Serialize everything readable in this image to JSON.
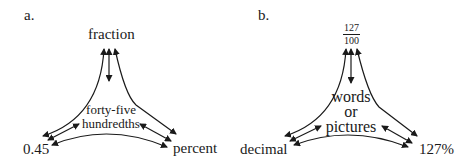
{
  "diagrams": [
    {
      "panel_label": "a.",
      "top_node": "fraction",
      "left_node": "0.45",
      "right_node": "percent",
      "center": {
        "line1": "forty-five",
        "line2": "hundredths"
      }
    },
    {
      "panel_label": "b.",
      "top_node": {
        "numerator": "127",
        "denominator": "100"
      },
      "left_node": "decimal",
      "right_node": "127%",
      "center": {
        "line1": "words",
        "line2": "or",
        "line3": "pictures"
      }
    }
  ],
  "colors": {
    "ink": "#1a1a1a",
    "background": "#ffffff"
  }
}
